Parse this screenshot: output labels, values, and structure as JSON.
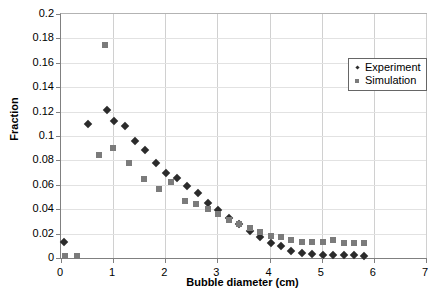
{
  "chart_data": {
    "type": "scatter",
    "title": "",
    "xlabel": "Bubble diameter (cm)",
    "ylabel": "Fraction",
    "xlim": [
      0,
      7
    ],
    "ylim": [
      0,
      0.2
    ],
    "xticks": [
      0,
      1,
      2,
      3,
      4,
      5,
      6,
      7
    ],
    "xticklabels": [
      "0",
      "1",
      "2",
      "3",
      "4",
      "5",
      "6",
      "7"
    ],
    "yticks": [
      0,
      0.02,
      0.04,
      0.06,
      0.08,
      0.1,
      0.12,
      0.14,
      0.16,
      0.18,
      0.2
    ],
    "yticklabels": [
      "0",
      "0.02",
      "0.04",
      "0.06",
      "0.08",
      "0.1",
      "0.12",
      "0.14",
      "0.16",
      "0.18",
      "0.2"
    ],
    "grid": true,
    "legend_position": "upper right",
    "series": [
      {
        "name": "Experiment",
        "marker": "diamond",
        "color": "#2b2b2b",
        "points": [
          [
            0.05,
            0.0135
          ],
          [
            0.52,
            0.1095
          ],
          [
            0.88,
            0.1215
          ],
          [
            1.02,
            0.1125
          ],
          [
            1.22,
            0.1085
          ],
          [
            1.42,
            0.0955
          ],
          [
            1.62,
            0.0885
          ],
          [
            1.82,
            0.0775
          ],
          [
            2.02,
            0.07
          ],
          [
            2.22,
            0.0655
          ],
          [
            2.42,
            0.059
          ],
          [
            2.62,
            0.053
          ],
          [
            2.82,
            0.045
          ],
          [
            3.02,
            0.039
          ],
          [
            3.22,
            0.033
          ],
          [
            3.42,
            0.0275
          ],
          [
            3.62,
            0.0225
          ],
          [
            3.82,
            0.0175
          ],
          [
            4.02,
            0.0125
          ],
          [
            4.22,
            0.01
          ],
          [
            4.42,
            0.0055
          ],
          [
            4.62,
            0.004
          ],
          [
            4.82,
            0.003
          ],
          [
            5.02,
            0.0028
          ],
          [
            5.22,
            0.0025
          ],
          [
            5.42,
            0.0023
          ],
          [
            5.62,
            0.0022
          ],
          [
            5.82,
            0.002
          ]
        ]
      },
      {
        "name": "Simulation",
        "marker": "square",
        "color": "#7b7b7b",
        "points": [
          [
            0.08,
            0.0015
          ],
          [
            0.3,
            0.0015
          ],
          [
            0.85,
            0.1745
          ],
          [
            0.72,
            0.0845
          ],
          [
            1.0,
            0.0905
          ],
          [
            1.3,
            0.078
          ],
          [
            1.6,
            0.065
          ],
          [
            1.88,
            0.0565
          ],
          [
            2.1,
            0.0625
          ],
          [
            2.38,
            0.047
          ],
          [
            2.58,
            0.044
          ],
          [
            2.82,
            0.04
          ],
          [
            3.02,
            0.036
          ],
          [
            3.22,
            0.0315
          ],
          [
            3.42,
            0.028
          ],
          [
            3.62,
            0.025
          ],
          [
            3.82,
            0.0215
          ],
          [
            4.02,
            0.018
          ],
          [
            4.22,
            0.0175
          ],
          [
            4.42,
            0.0145
          ],
          [
            4.62,
            0.0135
          ],
          [
            4.82,
            0.013
          ],
          [
            5.02,
            0.013
          ],
          [
            5.22,
            0.015
          ],
          [
            5.42,
            0.0125
          ],
          [
            5.62,
            0.012
          ],
          [
            5.82,
            0.0125
          ]
        ]
      }
    ]
  }
}
